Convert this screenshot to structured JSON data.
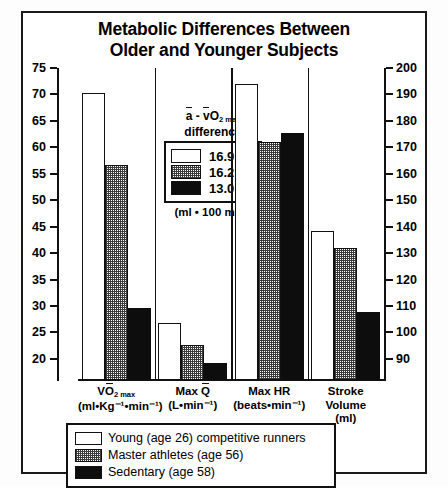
{
  "chart_data": {
    "type": "bar",
    "title": "Metabolic Differences Between Older and Younger Subjects",
    "title_line1": "Metabolic Differences Between",
    "title_line2": "Older and Younger Subjects",
    "xlabel": "",
    "ylabel": "",
    "grid": false,
    "legend_position": "bottom",
    "left_axis": {
      "ylim": [
        16,
        75
      ],
      "ticks": [
        75,
        70,
        65,
        60,
        55,
        50,
        45,
        40,
        35,
        30,
        25,
        20
      ],
      "tick_labels": [
        "75",
        "70",
        "65",
        "60",
        "55",
        "50",
        "45",
        "40",
        "35",
        "30",
        "25",
        "20"
      ]
    },
    "right_axis": {
      "ylim": [
        82,
        200
      ],
      "ticks": [
        200,
        190,
        180,
        170,
        160,
        150,
        140,
        130,
        120,
        110,
        100,
        90
      ],
      "tick_labels": [
        "200",
        "190",
        "180",
        "170",
        "160",
        "150",
        "140",
        "130",
        "120",
        "110",
        "100",
        "90"
      ]
    },
    "categories": [
      {
        "id": "vo2max",
        "line1_pre": "V",
        "line1_sym": "O",
        "line1_sub": "2 max",
        "line2": "(ml•Kg⁻¹•min⁻¹)",
        "label": "VO2 max (ml•Kg-1•min-1)",
        "axis": "left"
      },
      {
        "id": "max-q",
        "line1_pre": "Max ",
        "line1_sym": "Q",
        "line1_sub": "",
        "line2": "(L•min⁻¹)",
        "label": "Max Q (L•min-1)",
        "axis": "left"
      },
      {
        "id": "max-hr",
        "line1_pre": "Max HR",
        "line1_sym": "",
        "line1_sub": "",
        "line2": "(beats•min⁻¹)",
        "label": "Max HR (beats•min-1)",
        "axis": "right"
      },
      {
        "id": "stroke-volume",
        "line1_pre": "Stroke",
        "line1_sym": "",
        "line1_sub": "",
        "line2": "Volume",
        "line3": "(ml)",
        "label": "Stroke Volume (ml)",
        "axis": "left"
      }
    ],
    "series": [
      {
        "name": "Young (age 26) competitive runners",
        "key": "young",
        "pattern": "white",
        "values": [
          70.3,
          26.8,
          72.0,
          44.1
        ],
        "values_display": [
          "70.3",
          "26.8",
          "192 (right axis)",
          "44.1"
        ]
      },
      {
        "name": "Master athletes (age 56)",
        "key": "master",
        "pattern": "checker-gray",
        "values": [
          56.7,
          22.6,
          61.0,
          41.0
        ],
        "values_display": [
          "56.7",
          "22.6",
          "170 (right axis)",
          "41.0"
        ]
      },
      {
        "name": "Sedentary (age 58)",
        "key": "sedentary",
        "pattern": "solid-black",
        "values": [
          29.6,
          19.2,
          62.7,
          28.9
        ],
        "values_display": [
          "29.6",
          "19.2",
          "174 (right axis)",
          "28.9"
        ]
      }
    ]
  },
  "inner_legend": {
    "header_line1_a": "a",
    "header_line1_dash": " - ",
    "header_line1_v": "v",
    "header_line1_o": "O",
    "header_line1_sub": "2 max",
    "header_line2": "difference",
    "rows": [
      {
        "swatch": "young",
        "value": "16.9"
      },
      {
        "swatch": "master",
        "value": "16.2"
      },
      {
        "swatch": "sedentary",
        "value": "13.0"
      }
    ],
    "units": "(ml • 100 ml⁻¹)"
  },
  "bottom_legend": {
    "rows": [
      {
        "swatch": "young",
        "label": "Young (age 26) competitive runners"
      },
      {
        "swatch": "master",
        "label": "Master athletes (age 56)"
      },
      {
        "swatch": "sedentary",
        "label": "Sedentary (age 58)"
      }
    ]
  },
  "colors": {
    "ink": "#111111",
    "paper": "#ffffff",
    "sedentary_fill": "#0d0d0d",
    "master_fill": "#3a3a3a"
  }
}
